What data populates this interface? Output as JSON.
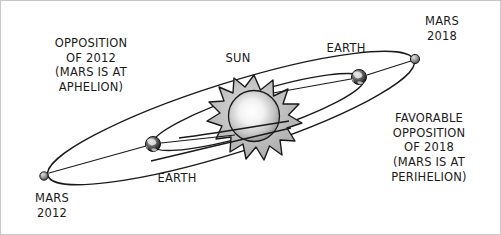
{
  "diagram": {
    "background_color": "#ffffff",
    "line_color": "#1a1a1a",
    "text_color": "#1a1a1a",
    "sun_color": "#b4b4b4",
    "annotations": {
      "left_block": "OPPOSITION\nOF 2012\n(MARS IS AT\nAPHELION)",
      "right_block": "FAVORABLE\nOPPOSITION\nOF 2018\n(MARS IS AT\nPERIHELION)"
    },
    "labels": {
      "sun": "SUN",
      "earth_right": "EARTH",
      "earth_left": "EARTH",
      "mars_2018": "MARS\n2018",
      "mars_2012": "MARS\n2012"
    },
    "bodies": [
      {
        "name": "sun",
        "label": "SUN",
        "x": 253,
        "y": 115,
        "radius": 26
      },
      {
        "name": "earth-right",
        "label": "EARTH",
        "x": 358,
        "y": 76,
        "radius": 7
      },
      {
        "name": "earth-left",
        "label": "EARTH",
        "x": 152,
        "y": 143,
        "radius": 7
      },
      {
        "name": "mars-2018",
        "label": "MARS 2018",
        "x": 414,
        "y": 58,
        "radius": 4.5
      },
      {
        "name": "mars-2012",
        "label": "MARS 2012",
        "x": 43,
        "y": 175,
        "radius": 4
      }
    ],
    "orbits": [
      {
        "name": "mars-orbit",
        "body": "Mars",
        "tilt_deg": -17,
        "semi_major": 190,
        "semi_minor": 34
      },
      {
        "name": "earth-orbit",
        "body": "Earth",
        "tilt_deg": -17,
        "semi_major": 110,
        "semi_minor": 19
      }
    ]
  }
}
